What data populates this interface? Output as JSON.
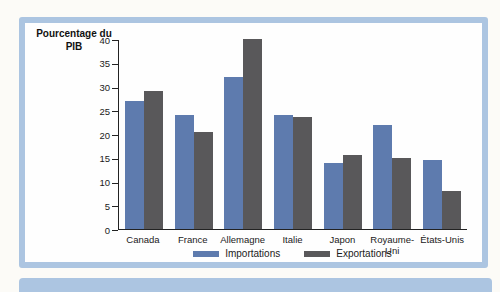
{
  "card": {
    "border_color": "#acc5e1",
    "background": "#fefefe"
  },
  "next_card_strip": {
    "color": "#acc5e1"
  },
  "chart_data": {
    "type": "bar",
    "title": "Pourcentage du PIB",
    "categories": [
      "Canada",
      "France",
      "Allemagne",
      "Italie",
      "Japon",
      "Royaume-Uni",
      "États-Unis"
    ],
    "series": [
      {
        "name": "Importations",
        "color": "#5e7bae",
        "values": [
          27,
          24,
          32,
          24,
          14,
          22,
          14.5
        ]
      },
      {
        "name": "Exportations",
        "color": "#59585a",
        "values": [
          29,
          20.5,
          40,
          23.5,
          15.5,
          15,
          8
        ]
      }
    ],
    "xlabel": "",
    "ylabel": "Pourcentage du PIB",
    "ylim": [
      0,
      40
    ],
    "yticks": [
      0,
      5,
      10,
      15,
      20,
      25,
      30,
      35,
      40
    ],
    "grid": false,
    "legend_position": "bottom",
    "axis_color": "#222222"
  }
}
